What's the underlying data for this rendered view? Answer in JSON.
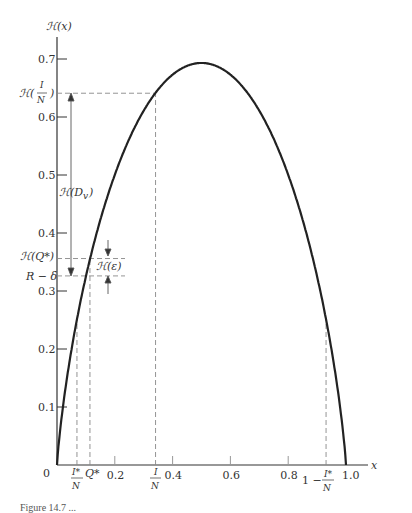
{
  "chart_data": {
    "type": "line",
    "title": "",
    "xlabel": "x",
    "ylabel": "ℋ(x)",
    "xlim": [
      0,
      1.0
    ],
    "ylim": [
      0,
      0.7
    ],
    "x_ticks": [
      "0.2",
      "0.4",
      "0.6",
      "0.8",
      "1.0"
    ],
    "y_ticks": [
      "0.1",
      "0.2",
      "0.3",
      "0.4",
      "0.5",
      "0.6",
      "0.7"
    ],
    "origin_label": "0",
    "grid": false,
    "series": [
      {
        "name": "ℋ(x) = −x ln x − (1−x) ln(1−x)",
        "x": [
          0,
          0.05,
          0.1,
          0.2,
          0.3,
          0.4,
          0.5,
          0.6,
          0.7,
          0.8,
          0.9,
          0.95,
          1.0
        ],
        "values": [
          0,
          0.199,
          0.325,
          0.5,
          0.611,
          0.673,
          0.693,
          0.673,
          0.611,
          0.5,
          0.325,
          0.199,
          0
        ]
      }
    ],
    "annotations": {
      "y_markers": [
        {
          "label_main": "ℋ(",
          "frac_num": "I",
          "frac_den": "N",
          "label_close": ")",
          "value": 0.641
        },
        {
          "label": "ℋ(Q*)",
          "value": 0.356
        },
        {
          "label": "R − δ",
          "value": 0.326
        }
      ],
      "x_markers": [
        {
          "frac_num": "I*",
          "frac_den": "N",
          "value": 0.069
        },
        {
          "label": "Q*",
          "value": 0.114
        },
        {
          "frac_num": "I",
          "frac_den": "N",
          "value": 0.341
        },
        {
          "prefix": "1 −",
          "frac_num": "I*",
          "frac_den": "N",
          "value": 0.931
        }
      ],
      "arrows": [
        {
          "label": "ℋ(D",
          "sub": "v",
          "close": ")",
          "from": 0.641,
          "to": 0.326
        },
        {
          "label": "ℋ(ε)",
          "between": [
            0.356,
            0.326
          ]
        }
      ]
    }
  },
  "caption": "Figure 14.7 ..."
}
